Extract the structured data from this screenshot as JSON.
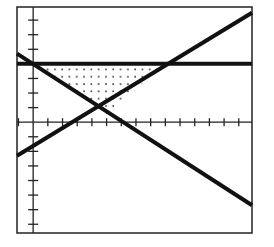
{
  "chart_data": {
    "type": "line",
    "title": "",
    "xlabel": "",
    "ylabel": "",
    "xlim": [
      -1.1,
      14.9
    ],
    "ylim": [
      -7.6,
      7.9
    ],
    "grid": false,
    "legend": null,
    "axes": {
      "x_tick_step": 1,
      "y_tick_step": 1,
      "x_tick_count_positive": 14,
      "x_tick_count_negative": 1,
      "y_tick_count_positive": 7,
      "y_tick_count_negative": 7
    },
    "series": [
      {
        "name": "horizontal line",
        "equation": "y = 4",
        "x": [
          -1.1,
          14.9
        ],
        "y": [
          4,
          4
        ]
      },
      {
        "name": "decreasing line",
        "equation": "y = 4 - 0.65x",
        "x": [
          -1.1,
          14.9
        ],
        "y": [
          4.7,
          -5.7
        ]
      },
      {
        "name": "increasing line",
        "equation": "y = 0.61x - 1.6",
        "x": [
          -1.1,
          14.9
        ],
        "y": [
          -2.3,
          7.5
        ]
      }
    ],
    "shaded_region": {
      "description": "dotted triangular region bounded above by y = 4 and below by the two diagonal lines",
      "vertices": [
        [
          0,
          4
        ],
        [
          8.9,
          4
        ],
        [
          5.1,
          0.5
        ]
      ],
      "fill": "dots"
    }
  },
  "style": {
    "line_color": "#111111",
    "frame_color": "#222222",
    "background": "#ffffff"
  }
}
